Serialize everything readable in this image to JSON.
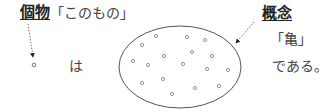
{
  "labels": {
    "individual_term": "個物",
    "individual_quote": "「このもの」",
    "concept_term": "概念",
    "concept_quote": "「亀」",
    "particle_wa": "は",
    "copula": "である。"
  },
  "diagram": {
    "ellipse": {
      "cx": 180,
      "cy": 67,
      "rx": 61,
      "ry": 41,
      "stroke": "#555555"
    },
    "individual_dot": {
      "cx": 34,
      "cy": 65
    },
    "dots": [
      {
        "cx": 156,
        "cy": 36
      },
      {
        "cx": 187,
        "cy": 37
      },
      {
        "cx": 205,
        "cy": 40
      },
      {
        "cx": 142,
        "cy": 45
      },
      {
        "cx": 164,
        "cy": 56
      },
      {
        "cx": 192,
        "cy": 52
      },
      {
        "cx": 212,
        "cy": 56
      },
      {
        "cx": 133,
        "cy": 61
      },
      {
        "cx": 148,
        "cy": 65
      },
      {
        "cx": 183,
        "cy": 64
      },
      {
        "cx": 207,
        "cy": 69
      },
      {
        "cx": 228,
        "cy": 70
      },
      {
        "cx": 142,
        "cy": 83
      },
      {
        "cx": 163,
        "cy": 79
      },
      {
        "cx": 195,
        "cy": 88
      },
      {
        "cx": 219,
        "cy": 86
      },
      {
        "cx": 172,
        "cy": 94
      }
    ],
    "arrows": [
      {
        "name": "individual-arrow",
        "x1": 28,
        "y1": 24,
        "x2": 33,
        "y2": 57
      },
      {
        "name": "concept-arrow",
        "x1": 254,
        "y1": 22,
        "x2": 236,
        "y2": 43
      }
    ]
  }
}
